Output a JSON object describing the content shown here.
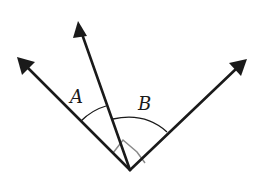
{
  "diagram": {
    "type": "angle-diagram",
    "vertex": {
      "x": 130,
      "y": 170
    },
    "rays": [
      {
        "name": "left-ray",
        "tip": {
          "x": 18,
          "y": 58
        }
      },
      {
        "name": "middle-ray",
        "tip": {
          "x": 79,
          "y": 22
        }
      },
      {
        "name": "right-ray",
        "tip": {
          "x": 246,
          "y": 60
        }
      }
    ],
    "angles": [
      {
        "label": "A",
        "between": [
          "left-ray",
          "middle-ray"
        ]
      },
      {
        "label": "B",
        "between": [
          "middle-ray",
          "right-ray"
        ]
      }
    ],
    "right_angle_marker": {
      "between": [
        "left-ray",
        "right-ray"
      ],
      "color": "#8a8a8a"
    },
    "colors": {
      "stroke": "#1a1a1a",
      "background": "#ffffff"
    }
  },
  "labels": {
    "angle_a": "A",
    "angle_b": "B"
  }
}
